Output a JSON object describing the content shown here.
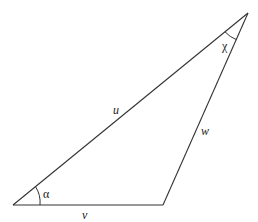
{
  "diagram": {
    "type": "triangle",
    "vertices": {
      "A": {
        "x": 13,
        "y": 205
      },
      "B": {
        "x": 248,
        "y": 13
      },
      "C": {
        "x": 163,
        "y": 205
      }
    },
    "sides": [
      {
        "id": "u",
        "label": "u",
        "from": "A",
        "to": "B"
      },
      {
        "id": "v",
        "label": "v",
        "from": "A",
        "to": "C"
      },
      {
        "id": "w",
        "label": "w",
        "from": "C",
        "to": "B"
      }
    ],
    "angles": [
      {
        "id": "alpha",
        "label": "α",
        "vertex": "A"
      },
      {
        "id": "chi",
        "label": "χ",
        "vertex": "B"
      }
    ],
    "line_color": "#333333"
  }
}
